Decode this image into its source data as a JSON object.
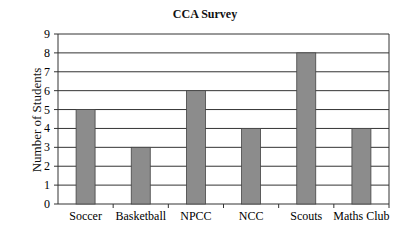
{
  "chart_data": {
    "type": "bar",
    "title": "CCA Survey",
    "xlabel": "",
    "ylabel": "Number of Students",
    "categories": [
      "Soccer",
      "Basketball",
      "NPCC",
      "NCC",
      "Scouts",
      "Maths Club"
    ],
    "values": [
      5,
      3,
      6,
      4,
      8,
      4
    ],
    "ylim": [
      0,
      9
    ],
    "yticks": [
      0,
      1,
      2,
      3,
      4,
      5,
      6,
      7,
      8,
      9
    ],
    "grid": true,
    "legend": null,
    "bar_color": "#8c8c8c"
  }
}
